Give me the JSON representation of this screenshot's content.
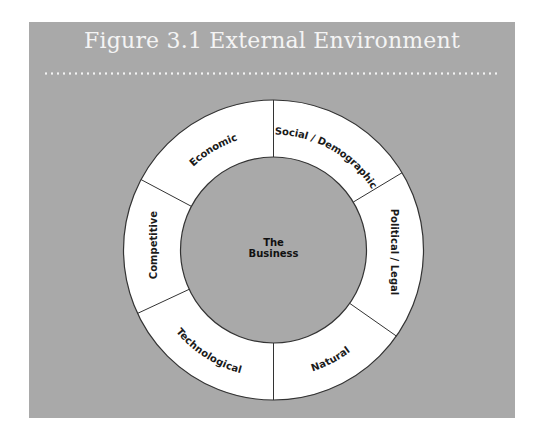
{
  "figure": {
    "title": "Figure 3.1  External Environment",
    "center_label_line1": "The",
    "center_label_line2": "Business",
    "colors": {
      "panel": "#a9a9a9",
      "ring": "#ffffff",
      "inner": "#a9a9a9",
      "stroke": "#333333",
      "title_text": "#f4f4f4"
    },
    "segments": [
      {
        "label": "Economic"
      },
      {
        "label": "Social / Demographic"
      },
      {
        "label": "Political / Legal"
      },
      {
        "label": "Natural"
      },
      {
        "label": "Technological"
      },
      {
        "label": "Competitive"
      }
    ]
  }
}
